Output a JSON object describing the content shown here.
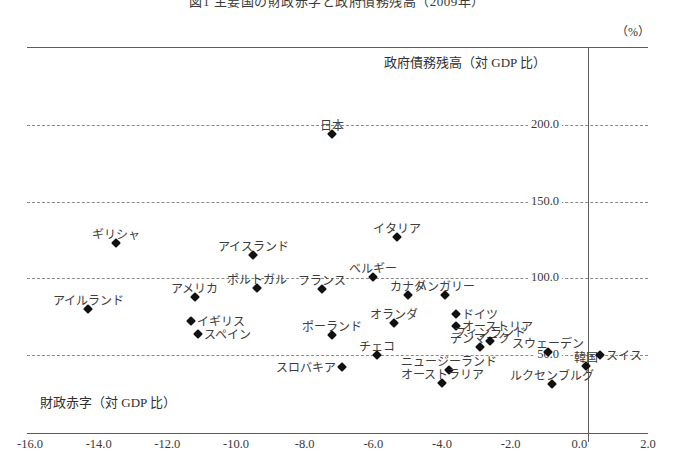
{
  "figure": {
    "title": "図1 主要国の財政赤字と政府債務残高（2009年）",
    "unit": "（%）",
    "y_caption": "政府債務残高（対 GDP 比）",
    "x_caption": "財政赤字（対 GDP 比）"
  },
  "chart_data": {
    "type": "scatter",
    "title": "主要国の財政赤字と政府債務残高",
    "xlabel": "財政赤字（対 GDP 比）",
    "ylabel": "政府債務残高（対 GDP 比）",
    "unit": "%",
    "xlim": [
      -16.0,
      2.0
    ],
    "ylim": [
      25.0,
      225.0
    ],
    "xticks": [
      "-16.0",
      "-14.0",
      "-12.0",
      "-10.0",
      "-8.0",
      "-6.0",
      "-4.0",
      "-2.0",
      "0.0",
      "2.0"
    ],
    "xtick_values": [
      -16.0,
      -14.0,
      -12.0,
      -10.0,
      -8.0,
      -6.0,
      -4.0,
      -2.0,
      0.0,
      2.0
    ],
    "yticks": [
      "200.0",
      "150.0",
      "100.0",
      "50.0"
    ],
    "ytick_values": [
      200.0,
      150.0,
      100.0,
      50.0
    ],
    "grid": "horizontal-dashed",
    "legend": "none",
    "points": [
      {
        "name": "日本",
        "x": -7.2,
        "y": 194.0,
        "label_pos": "above"
      },
      {
        "name": "ギリシャ",
        "x": -13.5,
        "y": 123.0,
        "label_pos": "above"
      },
      {
        "name": "アイスランド",
        "x": -9.5,
        "y": 115.0,
        "label_pos": "above"
      },
      {
        "name": "イタリア",
        "x": -5.3,
        "y": 127.0,
        "label_pos": "above"
      },
      {
        "name": "ベルギー",
        "x": -6.0,
        "y": 101.0,
        "label_pos": "above"
      },
      {
        "name": "アイルランド",
        "x": -14.3,
        "y": 80.0,
        "label_pos": "above"
      },
      {
        "name": "アメリカ",
        "x": -11.2,
        "y": 88.0,
        "label_pos": "above"
      },
      {
        "name": "ポルトガル",
        "x": -9.4,
        "y": 94.0,
        "label_pos": "above"
      },
      {
        "name": "フランス",
        "x": -7.5,
        "y": 93.0,
        "label_pos": "above"
      },
      {
        "name": "カナダ",
        "x": -5.0,
        "y": 89.0,
        "label_pos": "above"
      },
      {
        "name": "ハンガリー",
        "x": -3.9,
        "y": 89.0,
        "label_pos": "above"
      },
      {
        "name": "ドイツ",
        "x": -3.6,
        "y": 77.0,
        "label_pos": "right"
      },
      {
        "name": "オーストリア",
        "x": -3.6,
        "y": 69.0,
        "label_pos": "right"
      },
      {
        "name": "イギリス",
        "x": -11.3,
        "y": 72.0,
        "label_pos": "right"
      },
      {
        "name": "スペイン",
        "x": -11.1,
        "y": 64.0,
        "label_pos": "right"
      },
      {
        "name": "ポーランド",
        "x": -7.2,
        "y": 63.0,
        "label_pos": "above"
      },
      {
        "name": "オランダ",
        "x": -5.4,
        "y": 71.0,
        "label_pos": "above"
      },
      {
        "name": "チェコ",
        "x": -5.9,
        "y": 50.0,
        "label_pos": "above"
      },
      {
        "name": "デンマーク",
        "x": -2.9,
        "y": 55.0,
        "label_pos": "above"
      },
      {
        "name": "フィンランド",
        "x": -2.6,
        "y": 59.0,
        "label_pos": "above"
      },
      {
        "name": "スウェーデン",
        "x": -0.9,
        "y": 52.0,
        "label_pos": "above"
      },
      {
        "name": "スロバキア",
        "x": -6.9,
        "y": 42.0,
        "label_pos": "left"
      },
      {
        "name": "ニュージーランド",
        "x": -3.8,
        "y": 40.0,
        "label_pos": "above"
      },
      {
        "name": "オーストラリア",
        "x": -4.0,
        "y": 32.0,
        "label_pos": "above"
      },
      {
        "name": "ルクセンブルグ",
        "x": -0.8,
        "y": 31.0,
        "label_pos": "above"
      },
      {
        "name": "韓国",
        "x": 0.2,
        "y": 43.0,
        "label_pos": "above"
      },
      {
        "name": "スイス",
        "x": 0.6,
        "y": 50.0,
        "label_pos": "right"
      }
    ]
  },
  "axes_pixels": {
    "x_left_px": 30,
    "x_left_val": -16.0,
    "x_right_px": 648,
    "x_right_val": 2.0,
    "y_top_px": 125,
    "y_top_val": 200.0,
    "y_bot_px": 355,
    "y_bot_val": 50.0
  }
}
